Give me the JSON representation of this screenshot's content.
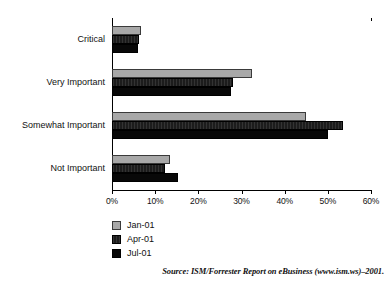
{
  "chart_data": {
    "type": "bar",
    "orientation": "horizontal",
    "title": "",
    "subtitle": "",
    "xlabel": "",
    "ylabel": "",
    "xlim": [
      0,
      60
    ],
    "grid": false,
    "legend_position": "bottom-left",
    "categories": [
      "Critical",
      "Very Important",
      "Somewhat Important",
      "Not Important"
    ],
    "tick_labels": [
      "0%",
      "10%",
      "20%",
      "30%",
      "40%",
      "50%",
      "60%"
    ],
    "tick_values": [
      0,
      10,
      20,
      30,
      40,
      50,
      60
    ],
    "series": [
      {
        "name": "Jan-01",
        "color": "#a8a8a8",
        "values": [
          6.7,
          32.5,
          45.0,
          13.4
        ]
      },
      {
        "name": "Apr-01",
        "color": "#1c1c1c",
        "values": [
          6.3,
          28.0,
          53.5,
          12.3
        ]
      },
      {
        "name": "Jul-01",
        "color": "#080808",
        "values": [
          6.0,
          27.5,
          50.0,
          15.3
        ]
      }
    ],
    "source_note": "Source: ISM/Forrester Report on eBusiness (www.ism.ws)–2001."
  },
  "legend": {
    "items": [
      {
        "label": "Jan-01"
      },
      {
        "label": "Apr-01"
      },
      {
        "label": "Jul-01"
      }
    ]
  },
  "axis": {
    "labels": [
      "0%",
      "10%",
      "20%",
      "30%",
      "40%",
      "50%",
      "60%"
    ]
  },
  "categories": {
    "items": [
      "Critical",
      "Very Important",
      "Somewhat Important",
      "Not Important"
    ]
  },
  "footer": {
    "source": "Source: ISM/Forrester Report on eBusiness (www.ism.ws)–2001."
  }
}
